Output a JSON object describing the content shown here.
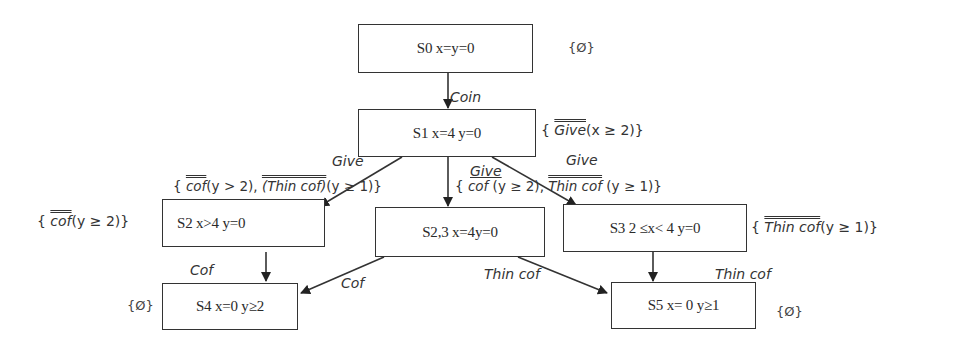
{
  "states": [
    {
      "id": "S0",
      "label": "S0   x=y=0"
    },
    {
      "id": "S1",
      "label": "S1  x=4 y=0"
    },
    {
      "id": "S2",
      "label": "S2 x>4 y=0"
    },
    {
      "id": "S23",
      "label": "S2,3   x=4y=0"
    },
    {
      "id": "S3",
      "label": "S3 2 ≤x< 4 y=0"
    },
    {
      "id": "S4",
      "label": "S4 x=0 y≥2"
    },
    {
      "id": "S5",
      "label": "S5 x= 0 y≥1"
    }
  ],
  "transitions": [
    {
      "from": "S0",
      "to": "S1",
      "label": "Coin"
    },
    {
      "from": "S1",
      "to": "S2",
      "label": "Give"
    },
    {
      "from": "S1",
      "to": "S23",
      "label": "Give"
    },
    {
      "from": "S1",
      "to": "S3",
      "label": "Give"
    },
    {
      "from": "S2",
      "to": "S4",
      "label": "Cof"
    },
    {
      "from": "S23",
      "to": "S4",
      "label": "Cof"
    },
    {
      "from": "S23",
      "to": "S5",
      "label": "Thin cof"
    },
    {
      "from": "S3",
      "to": "S5",
      "label": "Thin cof"
    }
  ],
  "sets": {
    "S0": "{Ø}",
    "S1_open": "{ ",
    "S1_act": "Give",
    "S1_cond": "(x ≥ 2)}",
    "S2": {
      "open": "{ ",
      "act": "cof",
      "cond": "(y ≥ 2)}"
    },
    "S2_edge": {
      "open": "{ ",
      "act1": "cof",
      "cond1": "(y > 2), ",
      "act2": "(Thin cof)",
      "cond2": "(y ≥ 1)}"
    },
    "S23_edge": {
      "open": "{ ",
      "act1": "cof",
      "cond1": " (y ≥ 2), ",
      "act2": "Thin cof",
      "cond2": " (y ≥ 1)}"
    },
    "S3": {
      "open": "{ ",
      "act": "Thin cof",
      "cond": "(y ≥ 1)}"
    },
    "S4": "{Ø}",
    "S5": "{Ø}"
  }
}
